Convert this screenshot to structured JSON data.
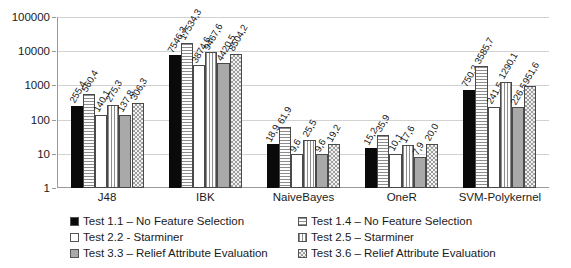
{
  "chart_data": {
    "type": "bar",
    "title": "",
    "xlabel": "",
    "ylabel": "",
    "scale": "log",
    "ylim": [
      1,
      100000
    ],
    "grid": true,
    "legend_position": "bottom",
    "ytick_labels": [
      "1",
      "10",
      "100",
      "1000",
      "10000",
      "100000"
    ],
    "ytick_values": [
      1,
      10,
      100,
      1000,
      10000,
      100000
    ],
    "categories": [
      "J48",
      "IBK",
      "NaiveBayes",
      "OneR",
      "SVM-Polykernel"
    ],
    "series": [
      {
        "name": "Test 1.1 – No Feature Selection",
        "pattern": "solid-black",
        "color": "#0a0a0a",
        "values": [
          255.4,
          7546.3,
          18.9,
          15.2,
          750.2
        ],
        "labels": [
          "255,4",
          "7546,3",
          "18,9",
          "15,2",
          "750,2"
        ]
      },
      {
        "name": "Test 1.4 – No Feature Selection",
        "pattern": "horizontal-stripe",
        "color": "#8d8d8d",
        "values": [
          560.4,
          17534.3,
          61.9,
          35.9,
          3585.7
        ],
        "labels": [
          "560,4",
          "17534,3",
          "61,9",
          "35,9",
          "3585,7"
        ]
      },
      {
        "name": "Test 2.2 - Starminer",
        "pattern": "white",
        "color": "#ffffff",
        "values": [
          140.1,
          3874.6,
          9.6,
          10.1,
          241.5
        ],
        "labels": [
          "140,1",
          "3874,6",
          "9,6",
          "10,1",
          "241,5"
        ]
      },
      {
        "name": "Test 2.5 – Starminer",
        "pattern": "vertical-stripe",
        "color": "#8d8d8d",
        "values": [
          275.3,
          9467.6,
          25.5,
          17.6,
          1290.1
        ],
        "labels": [
          "275,3",
          "9467,6",
          "25,5",
          "17,6",
          "1290,1"
        ]
      },
      {
        "name": "Test 3.3 – Relief Attribute Evaluation",
        "pattern": "solid-gray",
        "color": "#a9a9a9",
        "values": [
          137.8,
          4420.5,
          9.6,
          7.9,
          226.5
        ],
        "labels": [
          "137,8",
          "4420,5",
          "9,6",
          "7,9",
          "226,5"
        ]
      },
      {
        "name": "Test 3.6 – Relief Attribute Evaluation",
        "pattern": "checker",
        "color": "#9e9e9e",
        "values": [
          306.3,
          8504.2,
          19.2,
          20.0,
          951.6
        ],
        "labels": [
          "306,3",
          "8504,2",
          "19,2",
          "20,0",
          "951,6"
        ]
      }
    ]
  },
  "legend": {
    "items": [
      {
        "label": "Test 1.1 – No Feature Selection",
        "pattern": "solid-black"
      },
      {
        "label": "Test 1.4 – No Feature Selection",
        "pattern": "horizontal-stripe"
      },
      {
        "label": "Test 2.2 - Starminer",
        "pattern": "white"
      },
      {
        "label": "Test 2.5 – Starminer",
        "pattern": "vertical-stripe"
      },
      {
        "label": "Test 3.3 – Relief Attribute Evaluation",
        "pattern": "solid-gray"
      },
      {
        "label": "Test 3.6 – Relief Attribute Evaluation",
        "pattern": "checker"
      }
    ]
  }
}
